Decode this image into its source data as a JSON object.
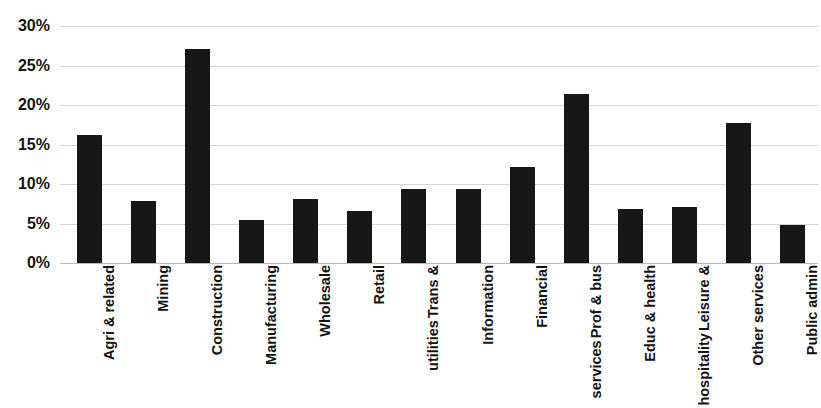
{
  "chart_data": {
    "type": "bar",
    "title": "BY INDUSTRY, 2005",
    "xlabel": "",
    "ylabel": "",
    "ylim": [
      0,
      30
    ],
    "yticks": [
      "0%",
      "5%",
      "10%",
      "15%",
      "20%",
      "25%",
      "30%"
    ],
    "ytick_values": [
      0,
      5,
      10,
      15,
      20,
      25,
      30
    ],
    "grid": true,
    "legend": false,
    "legend_position": "none",
    "bar_color": "#171717",
    "grid_color": "#d6d6d6",
    "categories": [
      "Agri & related",
      "Mining",
      "Construction",
      "Manufacturing",
      "Wholesale",
      "Retail",
      "Trans & utilities",
      "Information",
      "Financial",
      "Prof & bus services",
      "Educ & health",
      "Leisure & hospitality",
      "Other services",
      "Public admin"
    ],
    "category_lines": [
      [
        "Agri & related"
      ],
      [
        "Mining"
      ],
      [
        "Construction"
      ],
      [
        "Manufacturing"
      ],
      [
        "Wholesale"
      ],
      [
        "Retail"
      ],
      [
        "Trans &",
        "utilities"
      ],
      [
        "Information"
      ],
      [
        "Financial"
      ],
      [
        "Prof & bus",
        "services"
      ],
      [
        "Educ & health"
      ],
      [
        "Leisure &",
        "hospitality"
      ],
      [
        "Other services"
      ],
      [
        "Public admin"
      ]
    ],
    "values": [
      16.2,
      7.9,
      27.1,
      5.4,
      8.1,
      6.6,
      9.4,
      9.4,
      12.1,
      21.4,
      6.9,
      7.1,
      17.7,
      4.8
    ],
    "value_unit": "%"
  }
}
